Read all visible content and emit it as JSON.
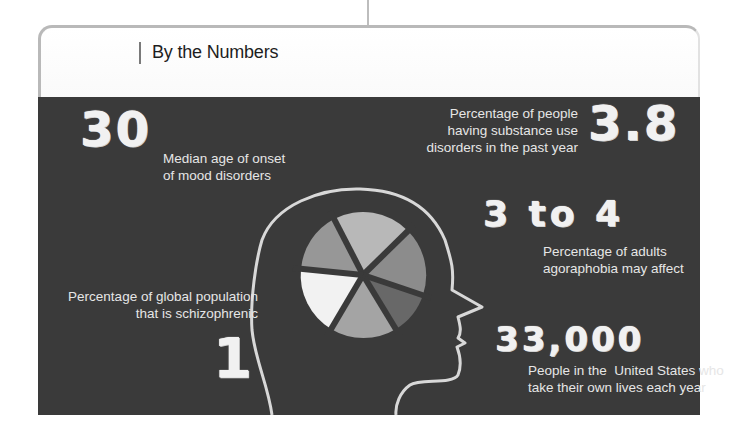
{
  "header": {
    "title": "By the Numbers"
  },
  "stats": [
    {
      "value": "30",
      "label_lines": [
        "Median age of onset",
        "of mood disorders"
      ]
    },
    {
      "value": "3.8",
      "label_lines": [
        "Percentage of people",
        "having substance use",
        "disorders in the past year"
      ]
    },
    {
      "value": "3 to 4",
      "label_lines": [
        "Percentage of adults",
        "agoraphobia may affect"
      ]
    },
    {
      "value": "1",
      "label_lines": [
        "Percentage of global population",
        "that is schizophrenic"
      ]
    },
    {
      "value": "33,000",
      "label_lines": [
        "People in the  United States who",
        "take their own lives each year"
      ]
    }
  ],
  "illustration": {
    "icon": "head-silhouette-with-pie-icon",
    "pie_slice_shades": [
      "#b5b5b5",
      "#8e8e8e",
      "#6a6a6a",
      "#a6a6a6",
      "#f3f3f3",
      "#9a9a9a"
    ]
  },
  "colors": {
    "panel_background": "#3a3a3a",
    "text": "#e6e6e6",
    "header_border": "#b9b9b9"
  }
}
